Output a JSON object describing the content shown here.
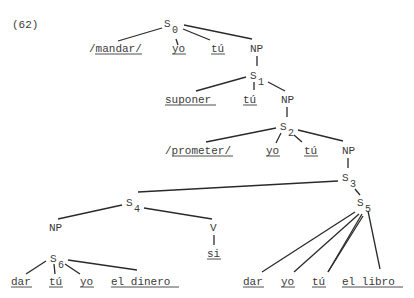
{
  "example_number": "(62)",
  "nodes": {
    "s0": {
      "label": "S",
      "sub": "0"
    },
    "s1": {
      "label": "S",
      "sub": "1"
    },
    "s2": {
      "label": "S",
      "sub": "2"
    },
    "s3": {
      "label": "S",
      "sub": "3"
    },
    "s4": {
      "label": "S",
      "sub": "4"
    },
    "s5": {
      "label": "S",
      "sub": "5"
    },
    "s6": {
      "label": "S",
      "sub": "6"
    },
    "np0": "NP",
    "np1": "NP",
    "np2": "NP",
    "np4": "NP",
    "v4": "V"
  },
  "leaves": {
    "s0": [
      "/mandar/",
      "yo",
      "tú"
    ],
    "s1": [
      "suponer",
      "tú"
    ],
    "s2": [
      "/prometer/",
      "yo",
      "tú"
    ],
    "v4": [
      "si"
    ],
    "s6": [
      "dar",
      "tú",
      "yo",
      "el dinero"
    ],
    "s5": [
      "dar",
      "yo",
      "tú",
      "el libro"
    ]
  }
}
